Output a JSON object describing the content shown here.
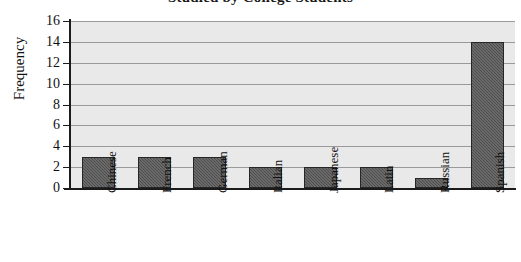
{
  "chart_data": {
    "type": "bar",
    "title": "Studied by College Students",
    "xlabel": "",
    "ylabel": "Frequency",
    "categories": [
      "Chinese",
      "French",
      "German",
      "Italian",
      "Japanese",
      "Latin",
      "Russian",
      "Spanish"
    ],
    "values": [
      3,
      3,
      3,
      2,
      2,
      2,
      1,
      14
    ],
    "ylim": [
      0,
      16
    ],
    "ytick_labels": [
      "0",
      "2",
      "4",
      "6",
      "8",
      "10",
      "12",
      "14",
      "16"
    ],
    "ytick_values": [
      0,
      2,
      4,
      6,
      8,
      10,
      12,
      14,
      16
    ],
    "grid": true,
    "legend": "none",
    "colors": {
      "bar_fill": "#4d4d4d",
      "bar_border": "#262626",
      "plot_background": "#e9e9e9",
      "gridline": "#9a9a9a",
      "axis": "#1b1b1b",
      "page_background": "#ffffff",
      "text": "#111111"
    }
  }
}
